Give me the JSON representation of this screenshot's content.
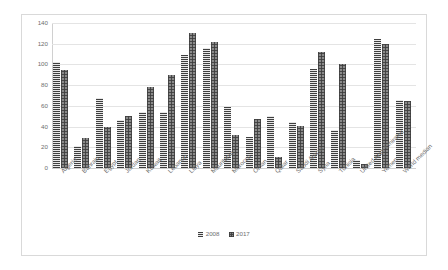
{
  "chart_data": {
    "type": "bar",
    "title": "",
    "xlabel": "",
    "ylabel": "",
    "ylim": [
      0,
      140
    ],
    "yticks": [
      0,
      20,
      40,
      60,
      80,
      100,
      120,
      140
    ],
    "grid": true,
    "legend_position": "bottom",
    "categories": [
      "Algeria",
      "Bahrain",
      "Egypt",
      "Jordan",
      "Kuwait",
      "Lebanon",
      "Libya",
      "Mauritania",
      "Morocco",
      "Oman",
      "Qatar",
      "Saudi Arabia",
      "Syria",
      "Tunisia",
      "United Arab Emirates",
      "Yemen",
      "World median"
    ],
    "series": [
      {
        "name": "2008",
        "pattern": "horizontal-stripes",
        "color": "#6f6f6f",
        "values": [
          102,
          21,
          68,
          46,
          54,
          54,
          109,
          116,
          59,
          30,
          50,
          44,
          96,
          37,
          8,
          125,
          66
        ]
      },
      {
        "name": "2017",
        "pattern": "checkered-dots",
        "color": "#8a8a8a",
        "values": [
          95,
          29,
          40,
          50,
          78,
          90,
          130,
          122,
          32,
          47,
          11,
          41,
          112,
          100,
          4,
          120,
          65
        ]
      }
    ]
  },
  "legend": {
    "items": [
      {
        "label": "2008"
      },
      {
        "label": "2017"
      }
    ]
  }
}
